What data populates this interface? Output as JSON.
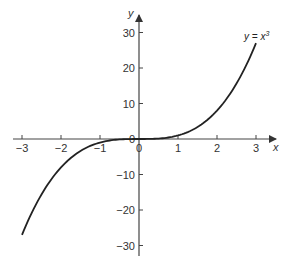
{
  "chart_data": {
    "type": "line",
    "title": "",
    "xlabel": "x",
    "ylabel": "y",
    "xlim": [
      -3,
      3
    ],
    "ylim": [
      -30,
      30
    ],
    "grid": false,
    "x_ticks": [
      -3,
      -2,
      -1,
      0,
      1,
      2,
      3
    ],
    "x_tick_labels": [
      "−3",
      "−2",
      "−1",
      "0",
      "1",
      "2",
      "3"
    ],
    "y_ticks": [
      -30,
      -20,
      -10,
      0,
      10,
      20,
      30
    ],
    "y_tick_labels": [
      "−30",
      "−20",
      "−10",
      "0",
      "10",
      "20",
      "30"
    ],
    "series": [
      {
        "name": "y = x^3",
        "x": [
          -3,
          -2.5,
          -2,
          -1.5,
          -1,
          -0.5,
          0,
          0.5,
          1,
          1.5,
          2,
          2.5,
          3
        ],
        "y": [
          -27,
          -15.625,
          -8,
          -3.375,
          -1,
          -0.125,
          0,
          0.125,
          1,
          3.375,
          8,
          15.625,
          27
        ]
      }
    ],
    "annotations": [
      {
        "text": "y = x³",
        "x": 2.75,
        "y": 28
      }
    ],
    "color": "#222222"
  },
  "labels": {
    "x_axis": "x",
    "y_axis": "y",
    "equation": "y = x",
    "exponent": "3"
  }
}
